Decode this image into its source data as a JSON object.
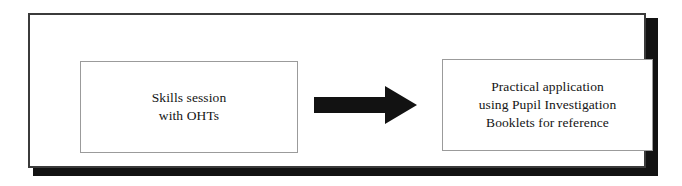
{
  "diagram": {
    "background_color": "#ffffff",
    "frame": {
      "border_color": "#3b3b3b",
      "shadow_color": "#121212"
    },
    "nodes": [
      {
        "id": "skills-session",
        "text": "Skills session\nwith OHTs",
        "lines": [
          "Skills session",
          "with OHTs"
        ],
        "border_color": "#9b9b9b",
        "fill_color": "#ffffff",
        "text_color": "#141414"
      },
      {
        "id": "practical-application",
        "text": "Practical application\nusing Pupil Investigation\nBooklets for reference",
        "lines": [
          "Practical application",
          "using Pupil Investigation",
          "Booklets for reference"
        ],
        "border_color": "#9b9b9b",
        "fill_color": "#ffffff",
        "text_color": "#141414"
      }
    ],
    "connector": {
      "id": "flow-arrow",
      "icon": "arrow-right-icon",
      "direction": "right",
      "color": "#121212",
      "from": "skills-session",
      "to": "practical-application"
    }
  }
}
